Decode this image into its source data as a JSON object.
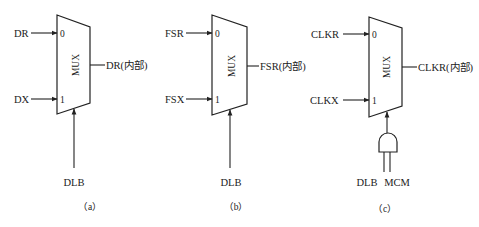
{
  "diagram": {
    "stroke_color": "#222222",
    "background": "#ffffff",
    "panels": [
      {
        "id": "a",
        "caption": "（a）",
        "block_label": "MUX",
        "input0_label": "DR",
        "input1_label": "DX",
        "pin0": "0",
        "pin1": "1",
        "output_label": "DR(内部)",
        "select_label": "DLB"
      },
      {
        "id": "b",
        "caption": "（b）",
        "block_label": "MUX",
        "input0_label": "FSR",
        "input1_label": "FSX",
        "pin0": "0",
        "pin1": "1",
        "output_label": "FSR(内部)",
        "select_label": "DLB"
      },
      {
        "id": "c",
        "caption": "（c）",
        "block_label": "MUX",
        "input0_label": "CLKR",
        "input1_label": "CLKX",
        "pin0": "0",
        "pin1": "1",
        "output_label": "CLKR(内部)",
        "select_gate": "AND",
        "select_label_a": "DLB",
        "select_label_b": "MCM"
      }
    ]
  }
}
